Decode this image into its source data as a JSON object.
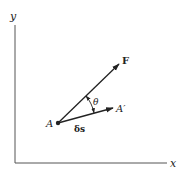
{
  "diagram": {
    "type": "vector-diagram",
    "axes": {
      "y_label": "y",
      "x_label": "x"
    },
    "point_a": {
      "label": "A"
    },
    "force_vector": {
      "label": "F"
    },
    "displacement_vector": {
      "label": "δs",
      "end_label": "A′"
    },
    "angle": {
      "label": "θ"
    },
    "colors": {
      "stroke": "#222222",
      "axis": "#555555",
      "background": "#ffffff"
    }
  }
}
